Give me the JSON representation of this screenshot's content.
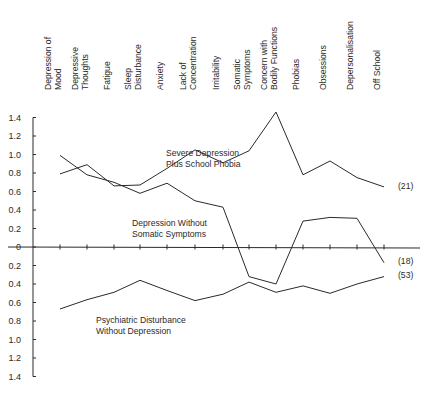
{
  "chart_data": {
    "type": "line",
    "title": "",
    "xlabel": "",
    "ylabel": "",
    "categories": [
      [
        "Depression of",
        "Mood"
      ],
      [
        "Depressive",
        "Thoughts"
      ],
      [
        "Fatigue"
      ],
      [
        "Sleep",
        "Disturbance"
      ],
      [
        "Anxiety"
      ],
      [
        "Lack of",
        "Concentration"
      ],
      [
        "Irritability"
      ],
      [
        "Somatic",
        "Symptoms"
      ],
      [
        "Concern with",
        "Bodily Functions"
      ],
      [
        "Phobias"
      ],
      [
        "Obsessions"
      ],
      [
        "Depersonalisation"
      ],
      [
        "Off School"
      ]
    ],
    "category_names": [
      "Depression of Mood",
      "Depressive Thoughts",
      "Fatigue",
      "Sleep Disturbance",
      "Anxiety",
      "Lack of Concentration",
      "Irritability",
      "Somatic Symptoms",
      "Concern with Bodily Functions",
      "Phobias",
      "Obsessions",
      "Depersonalisation",
      "Off School"
    ],
    "y_ticks": [
      1.4,
      1.2,
      1.0,
      0.8,
      0.6,
      0.4,
      0.2,
      0,
      -0.2,
      -0.4,
      -0.6,
      -0.8,
      -1.0,
      -1.2,
      -1.4
    ],
    "y_tick_labels": [
      "1.4",
      "1.2",
      "1.0",
      "0.8",
      "0.6",
      "0.4",
      "0.2",
      "0",
      "0.2",
      "0.4",
      "0.6",
      "0.8",
      "1.0",
      "1.2",
      "1.4"
    ],
    "ylim": [
      -1.4,
      1.4
    ],
    "grid": false,
    "legend": "inline labels",
    "series": [
      {
        "name": "Severe Depression Plus School Phobia",
        "label_lines": [
          "Severe Depression",
          "Plus School Phobia"
        ],
        "n": "(21)",
        "values": [
          0.79,
          0.89,
          0.66,
          0.67,
          0.85,
          1.05,
          0.91,
          1.04,
          1.46,
          0.78,
          0.93,
          0.75,
          0.65
        ]
      },
      {
        "name": "Depression Without Somatic Symptoms",
        "label_lines": [
          "Depression Without",
          "Somatic Symptoms"
        ],
        "n": "(18)",
        "values": [
          0.99,
          0.78,
          0.7,
          0.58,
          0.69,
          0.5,
          0.43,
          -0.32,
          -0.4,
          0.28,
          0.32,
          0.31,
          -0.17
        ]
      },
      {
        "name": "Psychiatric Disturbance Without Depression",
        "label_lines": [
          "Psychiatric Disturbance",
          "Without Depression"
        ],
        "n": "(53)",
        "values": [
          -0.67,
          -0.57,
          -0.49,
          -0.36,
          -0.47,
          -0.58,
          -0.51,
          -0.38,
          -0.49,
          -0.42,
          -0.5,
          -0.4,
          -0.32
        ]
      }
    ]
  },
  "layout": {
    "x_positions": [
      60,
      87,
      114,
      140,
      167,
      195,
      223,
      249,
      276,
      303,
      330,
      357,
      384
    ],
    "axis_x": 33,
    "zero_y": 247,
    "px_per_unit": 92.5,
    "axis_end_x": 420,
    "label_top_y": 6,
    "label_bottom_y": 90,
    "series_label_pos": [
      [
        166,
        156
      ],
      [
        132,
        226
      ],
      [
        96,
        323
      ]
    ],
    "n_label_pos": [
      [
        398,
        189
      ],
      [
        398,
        264
      ],
      [
        398,
        278
      ]
    ],
    "ink_color": "#2a2a2a"
  }
}
